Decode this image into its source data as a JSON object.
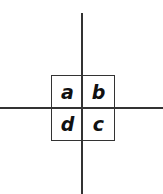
{
  "diagram": {
    "type": "quadrant-grid",
    "cells": {
      "top_left": "a",
      "top_right": "b",
      "bottom_left": "d",
      "bottom_right": "c"
    },
    "line_color": "#333333",
    "text_color": "#111111"
  }
}
